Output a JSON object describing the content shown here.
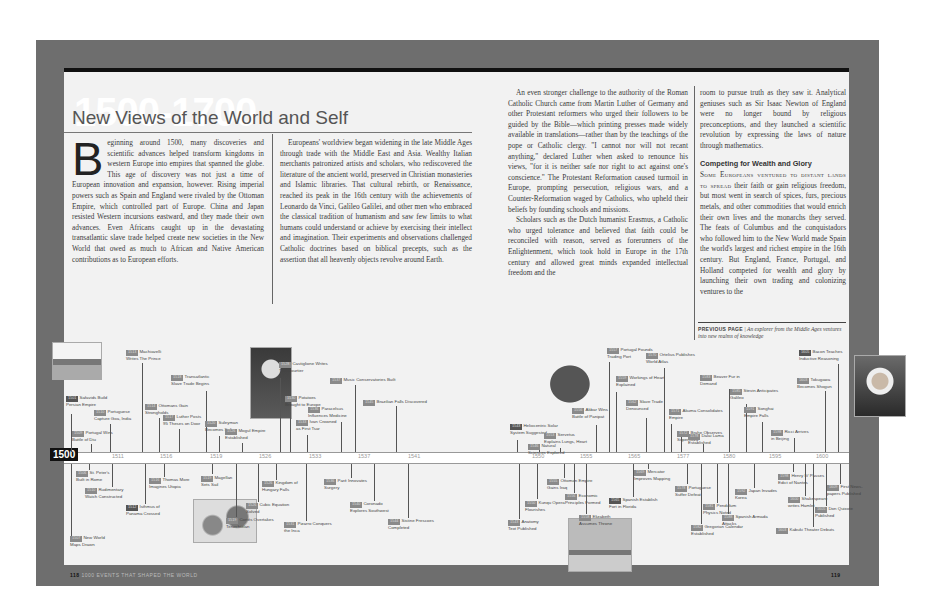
{
  "header": {
    "era": "1500-1700",
    "title": "New Views of the World and Self"
  },
  "columns": {
    "col1": {
      "dropcap": "B",
      "text": "eginning around 1500, many discoveries and scientific advances helped transform kingdoms in western Europe into empires that spanned the globe. This age of discovery was not just a time of European innovation and expansion, however. Rising imperial powers such as Spain and England were rivaled by the Ottoman Empire, which controlled part of Europe. China and Japan resisted Western incursions eastward, and they made their own advances. Even Africans caught up in the devastating transatlantic slave trade helped create new societies in the New World that owed as much to African and Native American contributions as to European efforts."
    },
    "col2": {
      "text": "Europeans' worldview began widening in the late Middle Ages through trade with the Middle East and Asia. Wealthy Italian merchants patronized artists and scholars, who rediscovered the literature of the ancient world, preserved in Christian monasteries and Islamic libraries. That cultural rebirth, or Renaissance, reached its peak in the 16th century with the achievements of Leonardo da Vinci, Galileo Galilei, and other men who embraced the classical tradition of humanism and saw few limits to what humans could understand or achieve by exercising their intellect and imagination. Their experiments and observations challenged Catholic doctrines based on biblical precepts, such as the assertion that all heavenly objects revolve around Earth."
    },
    "col3": {
      "p1": "An even stronger challenge to the authority of the Roman Catholic Church came from Martin Luther of Germany and other Protestant reformers who urged their followers to be guided by the Bible—which printing presses made widely available in translations—rather than by the teachings of the pope or Catholic clergy. \"I cannot nor will not recant anything,\" declared Luther when asked to renounce his views, \"for it is neither safe nor right to act against one's conscience.\" The Protestant Reformation caused turmoil in Europe, prompting persecution, religious wars, and a Counter-Reformation waged by Catholics, who upheld their beliefs by founding schools and missions.",
      "p2": "Scholars such as the Dutch humanist Erasmus, a Catholic who urged tolerance and believed that faith could be reconciled with reason, served as forerunners of the Enlightenment, which took hold in Europe in the 17th century and allowed great minds expanded intellectual freedom and the"
    },
    "col4": {
      "p1": "room to pursue truth as they saw it. Analytical geniuses such as Sir Isaac Newton of England were no longer bound by religious preconceptions, and they launched a scientific revolution by expressing the laws of nature through mathematics.",
      "subhead": "Competing for Wealth and Glory",
      "lead": "Some Europeans ventured to distant lands to spread",
      "p2": " their faith or gain religious freedom, but most went in search of spices, furs, precious metals, and other commodities that would enrich their own lives and the monarchs they served. The feats of Columbus and the conquistadors who followed him to the New World made Spain the world's largest and richest empire in the 16th century. But England, France, Portugal, and Holland competed for wealth and glory by launching their own trading and colonizing ventures to the"
    }
  },
  "caption": {
    "label": "PREVIOUS PAGE",
    "text": "An explorer from the Middle Ages ventures into new realms of knowledge"
  },
  "timeline": {
    "start": "1500",
    "ticks": [
      "1511",
      "1516",
      "1519",
      "1526",
      "1533",
      "1537",
      "1541",
      "1550",
      "1555",
      "1565",
      "1577",
      "1580",
      "1595",
      "1600"
    ],
    "above": [
      {
        "year": "1501",
        "l1": "Safavids Build",
        "l2": "Persian Empire"
      },
      {
        "year": "1509",
        "l1": "Portugal Wins",
        "l2": "Battle of Diu"
      },
      {
        "year": "1510",
        "l1": "Portuguese",
        "l2": "Capture Goa, India"
      },
      {
        "year": "1513",
        "l1": "Machiavelli",
        "l2": "Writes The Prince"
      },
      {
        "year": "1514",
        "l1": "Ottomans Gain",
        "l2": "Strongholds"
      },
      {
        "year": "1517",
        "l1": "Luther Posts",
        "l2": "95 Theses on Door"
      },
      {
        "year": "1518",
        "l1": "Transatlantic",
        "l2": "Slave Trade Begins"
      },
      {
        "year": "1520",
        "l1": "Suleyman",
        "l2": "Becomes Sultan"
      },
      {
        "year": "1526",
        "l1": "Mogul Empire",
        "l2": "Established"
      },
      {
        "year": "1528",
        "l1": "Castiglione Writes",
        "l2": "The Courtier"
      },
      {
        "year": "1530",
        "l1": "Potatoes",
        "l2": "Brought to Europe"
      },
      {
        "year": "1533",
        "l1": "Ivan Crowned",
        "l2": "as First Tsar"
      },
      {
        "year": "1536",
        "l1": "Paracelsus",
        "l2": "Influences Medicine"
      },
      {
        "year": "1537",
        "l1": "Music Conservatories Built",
        "l2": ""
      },
      {
        "year": "1545",
        "l1": "Brazilian Falls Discovered",
        "l2": ""
      },
      {
        "year": "1543",
        "l1": "Heliocentric Solar",
        "l2": "System Suggested"
      },
      {
        "year": "1546",
        "l1": "Natural",
        "l2": "Sciences Explored"
      },
      {
        "year": "1553",
        "l1": "Servetus",
        "l2": "Explains Lungs, Heart"
      },
      {
        "year": "1556",
        "l1": "Akbar Wins",
        "l2": "Battle of Panipat"
      },
      {
        "year": "1557",
        "l1": "Portugal Founds",
        "l2": "Trading Port"
      },
      {
        "year": "1559",
        "l1": "Workings of Heart",
        "l2": "Explained"
      },
      {
        "year": "1562",
        "l1": "Slave Trade",
        "l2": "Denounced"
      },
      {
        "year": "1570",
        "l1": "Ortelius Publishes",
        "l2": "World Atlas"
      },
      {
        "year": "1571",
        "l1": "Akuma Consolidates",
        "l2": "Empire"
      },
      {
        "year": "1572",
        "l1": "Brahe Observes",
        "l2": "Supernova"
      },
      {
        "year": "1578",
        "l1": "Dalai Lama",
        "l2": "Established"
      },
      {
        "year": "1583",
        "l1": "Beaver Fur in",
        "l2": "Demand"
      },
      {
        "year": "1585",
        "l1": "Stevin Anticipates",
        "l2": "Galileo"
      },
      {
        "year": "1591",
        "l1": "Songhai",
        "l2": "Empire Falls"
      },
      {
        "year": "1598",
        "l1": "Ricci Arrives",
        "l2": "in Beijing"
      },
      {
        "year": "1603",
        "l1": "Tokugawa",
        "l2": "Becomes Shogun"
      },
      {
        "year": "1605",
        "l1": "Bacon Teaches",
        "l2": "Inductive Reasoning"
      }
    ],
    "below": [
      {
        "year": "1507",
        "l1": "New World",
        "l2": "Maps Drawn"
      },
      {
        "year": "1506",
        "l1": "St. Peter's",
        "l2": "Built in Rome"
      },
      {
        "year": "1510",
        "l1": "Rudimentary",
        "l2": "Watch Constructed"
      },
      {
        "year": "1512",
        "l1": "Isthmus of",
        "l2": "Panama Crossed"
      },
      {
        "year": "1516",
        "l1": "Thomas More",
        "l2": "Imagines Utopia"
      },
      {
        "year": "1519",
        "l1": "Magellan",
        "l2": "Sets Sail"
      },
      {
        "year": "1519",
        "l1": "Cortés Overtakes",
        "l2": "Tenochtitlan"
      },
      {
        "year": "1526",
        "l1": "Kingdom of",
        "l2": "Hungary Falls"
      },
      {
        "year": "1526",
        "l1": "Cubic Equation",
        "l2": "Solved"
      },
      {
        "year": "1531",
        "l1": "Pizarro Conquers",
        "l2": "the Inca"
      },
      {
        "year": "1536",
        "l1": "Paré Innovates",
        "l2": "Surgery"
      },
      {
        "year": "1540",
        "l1": "Coronado",
        "l2": "Explores Southwest"
      },
      {
        "year": "1544",
        "l1": "Sistine Frescoes",
        "l2": "Completed"
      },
      {
        "year": "1543",
        "l1": "Anatomy",
        "l2": "Text Published"
      },
      {
        "year": "1550",
        "l1": "Kunqu Opera",
        "l2": "Flourishes"
      },
      {
        "year": "1555",
        "l1": "Ottoman Empire",
        "l2": "Gains Iraq"
      },
      {
        "year": "1556",
        "l1": "Economic",
        "l2": "Principles Formed"
      },
      {
        "year": "1558",
        "l1": "Elizabeth",
        "l2": "Assumes Throne"
      },
      {
        "year": "1565",
        "l1": "Spanish Establish",
        "l2": "Fort in Florida"
      },
      {
        "year": "1569",
        "l1": "Mercator",
        "l2": "Improves Mapping"
      },
      {
        "year": "1578",
        "l1": "Portuguese",
        "l2": "Suffer Defeat"
      },
      {
        "year": "1581",
        "l1": "Pendulum",
        "l2": "Physics Noted"
      },
      {
        "year": "1582",
        "l1": "Gregorian Calendar",
        "l2": "Established"
      },
      {
        "year": "1588",
        "l1": "Spanish Armada",
        "l2": "Attacks"
      },
      {
        "year": "1592",
        "l1": "Japan Invades",
        "l2": "Korea"
      },
      {
        "year": "1598",
        "l1": "Henry IV Passes",
        "l2": "Edict of Nantes"
      },
      {
        "year": "1600",
        "l1": "Shakespeare",
        "l2": "writes Hamlet"
      },
      {
        "year": "1603",
        "l1": "Kabuki Theater Debuts",
        "l2": ""
      },
      {
        "year": "1605",
        "l1": "Don Quixote",
        "l2": "Published"
      },
      {
        "year": "1609",
        "l1": "First News-",
        "l2": "papers Published"
      }
    ]
  },
  "footer": {
    "left_folio": "118",
    "left_running_head": "1000 EVENTS THAT SHAPED THE WORLD",
    "right_folio": "119"
  },
  "images": {
    "mosque": "persian-mosque-photo",
    "suleyman": "suleyman-portrait",
    "statue": "astronomer-statue",
    "bacon": "francis-bacon-portrait",
    "map": "new-world-map",
    "fort": "florida-fort-photo"
  }
}
